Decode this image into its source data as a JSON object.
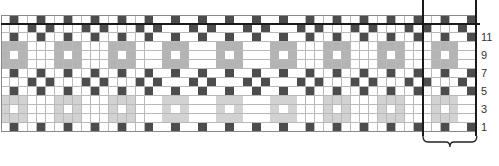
{
  "chart_title": "",
  "grid": {
    "columns": 53,
    "rows": 13,
    "repeat_start_col": 47,
    "repeat_width": 6,
    "cell_size": 8.97,
    "colors": {
      "W": "#ffffff",
      "D": "#4d4d4d",
      "G": "#b4b4b4",
      "L": "#d2d2d2"
    },
    "repeat_rows_top_to_bottom": [
      "WWDWWD",
      "DWWWDW",
      "WWDWWD",
      "WGGGWW",
      "WGWGWW",
      "WGGGWW",
      "WWDWWD",
      "DWWWDW",
      "WWDWWD",
      "WLLLWW",
      "WLWLWW",
      "WLLLWW",
      "WWDWWD"
    ]
  },
  "row_labels": [
    {
      "row": 11,
      "label": "11"
    },
    {
      "row": 9,
      "label": "9"
    },
    {
      "row": 7,
      "label": "7"
    },
    {
      "row": 5,
      "label": "5"
    },
    {
      "row": 3,
      "label": "3"
    },
    {
      "row": 1,
      "label": "1"
    }
  ],
  "repeat_bracket": "6-stitch repeat"
}
